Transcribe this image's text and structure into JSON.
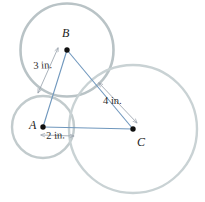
{
  "figure": {
    "background": "#ffffff",
    "circle_stroke": "#b9c3c6",
    "circle_stroke_light": "#c9d2d4",
    "segment_color": "#6f97bd",
    "dimension_color": "#9aa3ad",
    "point_color": "#101010",
    "circles": [
      {
        "id": "circle-B",
        "center_label": "B",
        "cx": 67,
        "cy": 50,
        "r": 46.5
      },
      {
        "id": "circle-A",
        "center_label": "A",
        "cx": 43,
        "cy": 127,
        "r": 31.0
      },
      {
        "id": "circle-C",
        "center_label": "C",
        "cx": 133,
        "cy": 129,
        "r": 64.0
      }
    ],
    "points": [
      {
        "id": "point-A",
        "label": "A",
        "x": 43,
        "y": 127
      },
      {
        "id": "point-B",
        "label": "B",
        "x": 67,
        "y": 50
      },
      {
        "id": "point-C",
        "label": "C",
        "x": 133,
        "y": 129
      }
    ],
    "point_labels": {
      "A": {
        "text": "A",
        "x": 29,
        "y": 120
      },
      "B": {
        "text": "B",
        "x": 62,
        "y": 28
      },
      "C": {
        "text": "C",
        "x": 137,
        "y": 138
      }
    },
    "segments": [
      {
        "id": "segment-AB",
        "from": "A",
        "to": "B",
        "x1": 43,
        "y1": 127,
        "x2": 67,
        "y2": 50
      },
      {
        "id": "segment-BC",
        "from": "B",
        "to": "C",
        "x1": 67,
        "y1": 50,
        "x2": 133,
        "y2": 129
      },
      {
        "id": "segment-AC",
        "from": "A",
        "to": "C",
        "x1": 43,
        "y1": 127,
        "x2": 133,
        "y2": 129
      }
    ],
    "dimensions": [
      {
        "id": "dimension-3in",
        "label": "3 in.",
        "value": 3,
        "unit": "in.",
        "measures": "B to tangency point on segment AB",
        "label_x": 33,
        "label_y": 63,
        "x1": 58,
        "y1": 48,
        "x2": 38,
        "y2": 93
      },
      {
        "id": "dimension-2in",
        "label": "2 in.",
        "value": 2,
        "unit": "in.",
        "measures": "A to tangency point on segment AC",
        "label_x": 48,
        "label_y": 132,
        "x1": 41,
        "y1": 135,
        "x2": 74,
        "y2": 136
      },
      {
        "id": "dimension-4in",
        "label": "4 in.",
        "value": 4,
        "unit": "in.",
        "measures": "tangency point on segment BC to C",
        "label_x": 104,
        "label_y": 98,
        "x1": 99,
        "y1": 83,
        "x2": 137,
        "y2": 123
      }
    ]
  }
}
